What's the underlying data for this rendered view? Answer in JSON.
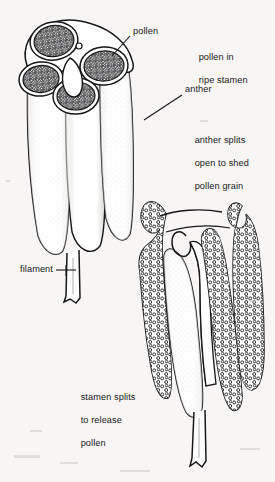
{
  "figure": {
    "background_color": "#f7f6f4",
    "ink_color": "#17171a",
    "style": "black-and-white line drawing / scanned botanical illustration"
  },
  "labels": {
    "pollen": {
      "text": "pollen",
      "x": 133,
      "y": 31
    },
    "pollen_in_ripe_stamen": {
      "line1": "pollen in",
      "line2": "ripe stamen",
      "x": 188,
      "y": 46
    },
    "anther": {
      "text": "anther",
      "x": 185,
      "y": 89
    },
    "anther_splits": {
      "line1": "anther splits",
      "line2": "open to shed",
      "line3": "pollen grain",
      "x": 184,
      "y": 129
    },
    "filament": {
      "text": "filament",
      "x": 20,
      "y": 266
    },
    "stamen_splits": {
      "line1": "stamen splits",
      "line2": "to release",
      "line3": "pollen",
      "x": 70,
      "y": 385
    }
  },
  "drawing": {
    "upper_stamen": {
      "name": "ripe stamen with intact anther",
      "parts": [
        "pollen sacs",
        "anther",
        "filament"
      ],
      "pollen_sac_count": 4
    },
    "lower_stamen": {
      "name": "split stamen shedding pollen",
      "parts": [
        "split anther walls",
        "pollen grains",
        "filament"
      ],
      "lobe_count": 3
    }
  }
}
